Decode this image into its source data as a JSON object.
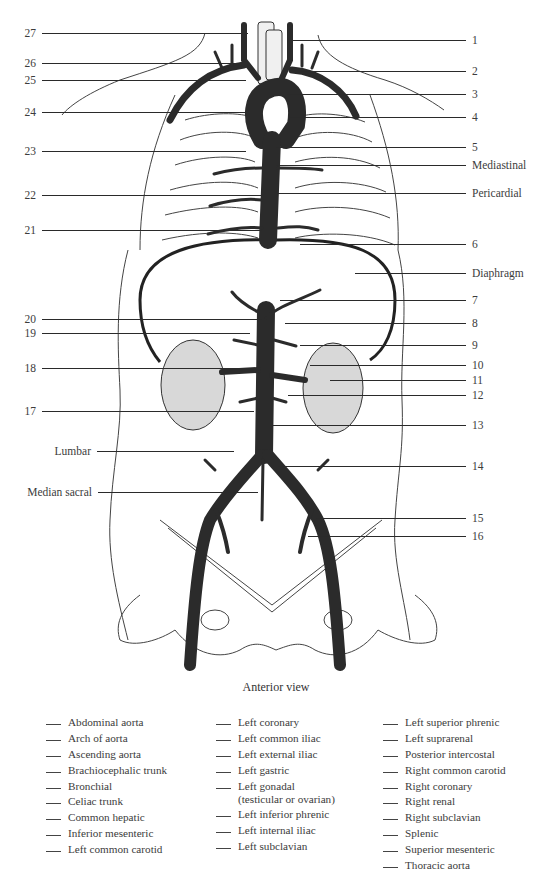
{
  "figure": {
    "caption": "Anterior view",
    "left_labels": [
      {
        "text": "27",
        "y": 33,
        "line_x1": 42,
        "line_x2": 248
      },
      {
        "text": "26",
        "y": 63,
        "line_x1": 42,
        "line_x2": 240
      },
      {
        "text": "25",
        "y": 80,
        "line_x1": 42,
        "line_x2": 246
      },
      {
        "text": "24",
        "y": 112,
        "line_x1": 42,
        "line_x2": 246
      },
      {
        "text": "23",
        "y": 151,
        "line_x1": 42,
        "line_x2": 246
      },
      {
        "text": "22",
        "y": 195,
        "line_x1": 42,
        "line_x2": 262
      },
      {
        "text": "21",
        "y": 230,
        "line_x1": 42,
        "line_x2": 262
      },
      {
        "text": "20",
        "y": 319,
        "line_x1": 42,
        "line_x2": 262
      },
      {
        "text": "19",
        "y": 333,
        "line_x1": 42,
        "line_x2": 250
      },
      {
        "text": "18",
        "y": 368,
        "line_x1": 42,
        "line_x2": 250
      },
      {
        "text": "17",
        "y": 411,
        "line_x1": 42,
        "line_x2": 254
      },
      {
        "text": "Lumbar",
        "y": 451,
        "line_x1": 97,
        "line_x2": 234
      },
      {
        "text": "Median sacral",
        "y": 492,
        "line_x1": 98,
        "line_x2": 258
      }
    ],
    "right_labels": [
      {
        "text": "1",
        "y": 40,
        "line_x1": 290,
        "line_x2": 466
      },
      {
        "text": "2",
        "y": 71,
        "line_x1": 300,
        "line_x2": 466
      },
      {
        "text": "3",
        "y": 94,
        "line_x1": 287,
        "line_x2": 466
      },
      {
        "text": "4",
        "y": 117,
        "line_x1": 290,
        "line_x2": 466
      },
      {
        "text": "5",
        "y": 147,
        "line_x1": 276,
        "line_x2": 466
      },
      {
        "text": "Mediastinal",
        "y": 165,
        "line_x1": 276,
        "line_x2": 466
      },
      {
        "text": "Pericardial",
        "y": 193,
        "line_x1": 276,
        "line_x2": 466
      },
      {
        "text": "6",
        "y": 244,
        "line_x1": 300,
        "line_x2": 466
      },
      {
        "text": "Diaphragm",
        "y": 273,
        "line_x1": 355,
        "line_x2": 466
      },
      {
        "text": "7",
        "y": 300,
        "line_x1": 280,
        "line_x2": 466
      },
      {
        "text": "8",
        "y": 323,
        "line_x1": 285,
        "line_x2": 466
      },
      {
        "text": "9",
        "y": 345,
        "line_x1": 300,
        "line_x2": 466
      },
      {
        "text": "10",
        "y": 365,
        "line_x1": 310,
        "line_x2": 466
      },
      {
        "text": "11",
        "y": 380,
        "line_x1": 330,
        "line_x2": 466
      },
      {
        "text": "12",
        "y": 395,
        "line_x1": 288,
        "line_x2": 466
      },
      {
        "text": "13",
        "y": 425,
        "line_x1": 272,
        "line_x2": 466
      },
      {
        "text": "14",
        "y": 466,
        "line_x1": 278,
        "line_x2": 466
      },
      {
        "text": "15",
        "y": 518,
        "line_x1": 316,
        "line_x2": 466
      },
      {
        "text": "16",
        "y": 536,
        "line_x1": 308,
        "line_x2": 466
      }
    ]
  },
  "word_bank": {
    "columns": [
      [
        "Abdominal aorta",
        "Arch of aorta",
        "Ascending aorta",
        "Brachiocephalic trunk",
        "Bronchial",
        "Celiac trunk",
        "Common hepatic",
        "Inferior mesenteric",
        "Left common carotid"
      ],
      [
        "Left coronary",
        "Left common iliac",
        "Left external iliac",
        "Left gastric",
        "Left gonadal\n(testicular or ovarian)",
        "Left inferior phrenic",
        "Left internal iliac",
        "Left subclavian"
      ],
      [
        "Left superior phrenic",
        "Left suprarenal",
        "Posterior intercostal",
        "Right common carotid",
        "Right coronary",
        "Right renal",
        "Right subclavian",
        "Splenic",
        "Superior mesenteric",
        "Thoracic aorta"
      ]
    ]
  },
  "colors": {
    "artery": "#2b2b2b",
    "outline": "#333333",
    "text": "#3c3c3c",
    "background": "#ffffff"
  }
}
